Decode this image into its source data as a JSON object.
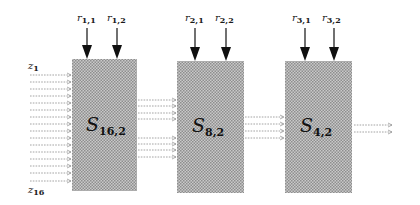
{
  "diagram": {
    "inputs": {
      "first_label": "z",
      "first_sub": "1",
      "last_label": "z",
      "last_sub": "16",
      "count": 16
    },
    "stages": [
      {
        "name": "S",
        "sub": "16,2",
        "controls": [
          {
            "label": "r",
            "sub": "1,1"
          },
          {
            "label": "r",
            "sub": "1,2"
          }
        ],
        "outputs": 8
      },
      {
        "name": "S",
        "sub": "8,2",
        "controls": [
          {
            "label": "r",
            "sub": "2,1"
          },
          {
            "label": "r",
            "sub": "2,2"
          }
        ],
        "outputs": 4
      },
      {
        "name": "S",
        "sub": "4,2",
        "controls": [
          {
            "label": "r",
            "sub": "3,1"
          },
          {
            "label": "r",
            "sub": "3,2"
          }
        ],
        "outputs": 2
      }
    ],
    "colors": {
      "box_fill": "#b8b8b8",
      "box_dot": "#8c8c8c",
      "line": "#888888",
      "arrow": "#111111"
    }
  }
}
